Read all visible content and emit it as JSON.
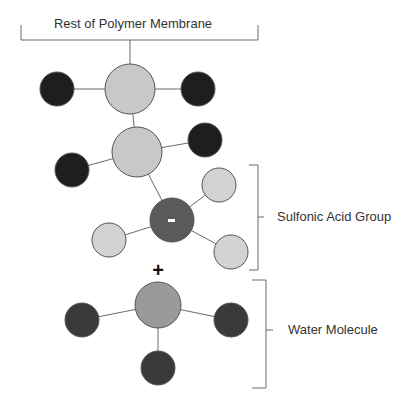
{
  "labels": {
    "membrane": "Rest of Polymer Membrane",
    "sulfonic": "Sulfonic Acid Group",
    "water": "Water Molecule",
    "plus": "+",
    "minus": "-"
  },
  "colors": {
    "carbon": "#c8c8c8",
    "fluorine": "#1e1e1e",
    "sulfur": "#5a5a5a",
    "oxygen": "#d2d2d2",
    "water_center": "#9a9a9a",
    "hydrogen": "#3a3a3a"
  },
  "atoms": [
    {
      "id": "carbon-1",
      "kind": "carbon"
    },
    {
      "id": "fluorine-1",
      "kind": "fluorine"
    },
    {
      "id": "fluorine-2",
      "kind": "fluorine"
    },
    {
      "id": "carbon-2",
      "kind": "carbon"
    },
    {
      "id": "fluorine-3",
      "kind": "fluorine"
    },
    {
      "id": "fluorine-4",
      "kind": "fluorine"
    },
    {
      "id": "sulfur",
      "kind": "sulfur"
    },
    {
      "id": "oxygen-1",
      "kind": "oxygen"
    },
    {
      "id": "oxygen-2",
      "kind": "oxygen"
    },
    {
      "id": "oxygen-3",
      "kind": "oxygen"
    },
    {
      "id": "water-center",
      "kind": "water_center"
    },
    {
      "id": "hydrogen-1",
      "kind": "hydrogen"
    },
    {
      "id": "hydrogen-2",
      "kind": "hydrogen"
    },
    {
      "id": "hydrogen-3",
      "kind": "hydrogen"
    }
  ]
}
